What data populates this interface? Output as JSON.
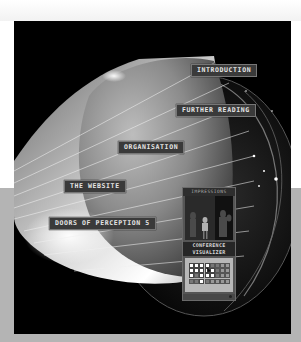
{
  "nav_labels": {
    "introduction": "INTRODUCTION",
    "further_reading": "FURTHER READING",
    "organisation": "ORGANISATION",
    "the_website": "THE WEBSITE",
    "doors_of_perception": "DOORS OF PERCEPTION 5"
  },
  "card": {
    "title": "IMPRESSIONS",
    "heading_line1": "CONFERENCE",
    "heading_line2": "VISUALIZER",
    "grid": {
      "columns": 8,
      "rows": 4,
      "cells": [
        "on",
        "on",
        "on",
        "on",
        "off",
        "off",
        "dim",
        "dim",
        "on",
        "on",
        "on",
        "on",
        "on",
        "off",
        "dim",
        "dim",
        "on",
        "off",
        "on",
        "on",
        "on",
        "off",
        "dim",
        "dim",
        "off",
        "off",
        "on",
        "off",
        "dim",
        "dim",
        "dim",
        "dim"
      ]
    }
  },
  "colors": {
    "background": "#ffffff",
    "band": "#b4b4b4",
    "panel": "#000000",
    "label_bg": "#3a3a3a",
    "label_text": "#e6e6e6"
  }
}
